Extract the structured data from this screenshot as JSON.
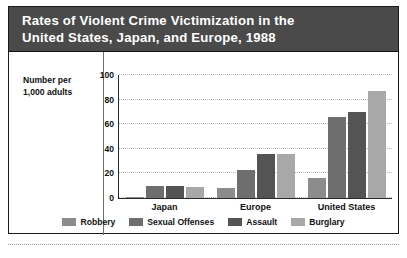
{
  "figure": {
    "title": "Rates of Violent Crime Victimization in the\nUnited States, Japan, and Europe, 1988",
    "axis_title": "Number per\n1,000 adults"
  },
  "chart_data": {
    "type": "bar",
    "title": "Rates of Violent Crime Victimization in the United States, Japan, and Europe, 1988",
    "xlabel": "",
    "ylabel": "Number per 1,000 adults",
    "categories": [
      "Japan",
      "Europe",
      "United States"
    ],
    "series": [
      {
        "name": "Robbery",
        "color": "#8c8c8c",
        "values": [
          1,
          8,
          16
        ]
      },
      {
        "name": "Sexual Offenses",
        "color": "#6e6e6e",
        "values": [
          10,
          23,
          66
        ]
      },
      {
        "name": "Assault",
        "color": "#545454",
        "values": [
          10,
          36,
          70
        ]
      },
      {
        "name": "Burglary",
        "color": "#a8a8a8",
        "values": [
          9,
          36,
          87
        ]
      }
    ],
    "ylim": [
      0,
      100
    ],
    "yticks": [
      0,
      20,
      40,
      60,
      80,
      100
    ],
    "ytick_labels": [
      "0",
      "20",
      "40",
      "60",
      "80",
      "100"
    ],
    "grid": true,
    "legend_position": "bottom"
  },
  "colors": {
    "title_bar": "#4a4a4a",
    "title_text": "#ffffff",
    "frame": "#1b1b1b",
    "gridline": "#b9b9b9",
    "axis": "#2a2a2a"
  }
}
